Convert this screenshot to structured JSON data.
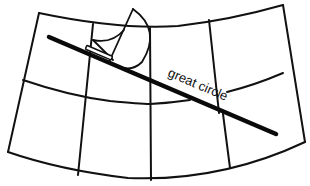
{
  "diagram": {
    "type": "map-projection-grid",
    "labels": {
      "great_circle": "great circle"
    },
    "colors": {
      "line": "#111111",
      "background": "#ffffff"
    },
    "elements": [
      "outer-boundary",
      "meridians",
      "middle-parallel",
      "great-circle-route",
      "straightedge",
      "compass-arc"
    ]
  }
}
